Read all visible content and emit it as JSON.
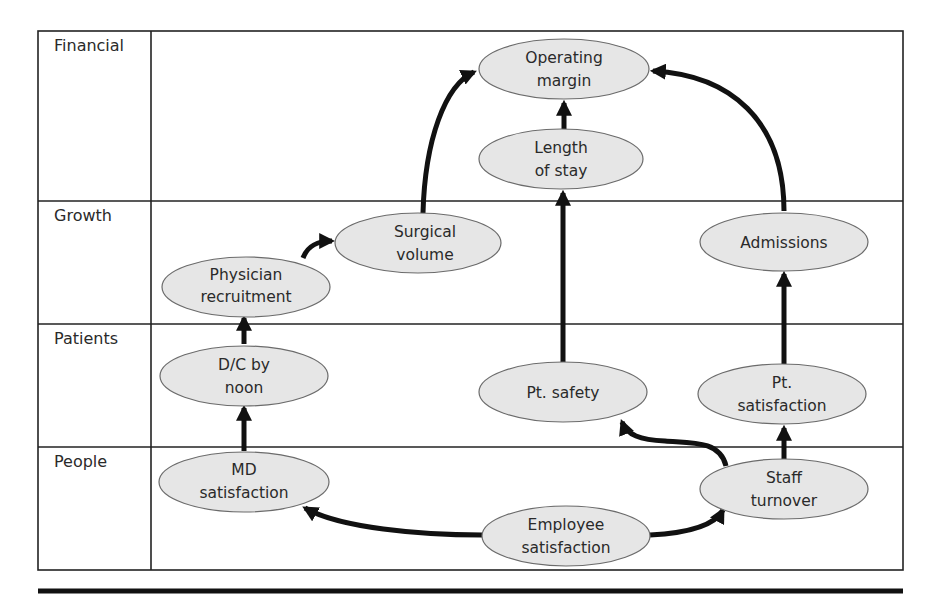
{
  "diagram": {
    "type": "strategy map",
    "rows": [
      {
        "id": "financial",
        "label": "Financial"
      },
      {
        "id": "growth",
        "label": "Growth"
      },
      {
        "id": "patients",
        "label": "Patients"
      },
      {
        "id": "people",
        "label": "People"
      }
    ],
    "nodes": {
      "operating_margin": {
        "line1": "Operating",
        "line2": "margin",
        "row": "financial"
      },
      "length_of_stay": {
        "line1": "Length",
        "line2": "of stay",
        "row": "financial"
      },
      "surgical_volume": {
        "line1": "Surgical",
        "line2": "volume",
        "row": "growth"
      },
      "admissions": {
        "line1": "Admissions",
        "line2": "",
        "row": "growth"
      },
      "physician_recruitment": {
        "line1": "Physician",
        "line2": "recruitment",
        "row": "growth"
      },
      "dc_by_noon": {
        "line1": "D/C by",
        "line2": "noon",
        "row": "patients"
      },
      "pt_safety": {
        "line1": "Pt. safety",
        "line2": "",
        "row": "patients"
      },
      "pt_satisfaction": {
        "line1": "Pt.",
        "line2": "satisfaction",
        "row": "patients"
      },
      "md_satisfaction": {
        "line1": "MD",
        "line2": "satisfaction",
        "row": "people"
      },
      "staff_turnover": {
        "line1": "Staff",
        "line2": "turnover",
        "row": "people"
      },
      "employee_satisfaction": {
        "line1": "Employee",
        "line2": "satisfaction",
        "row": "people"
      }
    },
    "edges": [
      {
        "from": "Employee satisfaction",
        "to": "MD satisfaction"
      },
      {
        "from": "Employee satisfaction",
        "to": "Staff turnover"
      },
      {
        "from": "MD satisfaction",
        "to": "D/C by noon"
      },
      {
        "from": "D/C by noon",
        "to": "Physician recruitment"
      },
      {
        "from": "Physician recruitment",
        "to": "Surgical volume"
      },
      {
        "from": "Surgical volume",
        "to": "Operating margin"
      },
      {
        "from": "Staff turnover",
        "to": "Pt. safety"
      },
      {
        "from": "Staff turnover",
        "to": "Pt. satisfaction"
      },
      {
        "from": "Pt. satisfaction",
        "to": "Admissions"
      },
      {
        "from": "Admissions",
        "to": "Operating margin"
      },
      {
        "from": "Pt. safety",
        "to": "Length of stay"
      },
      {
        "from": "Length of stay",
        "to": "Operating margin"
      }
    ],
    "colors": {
      "node_fill": "#e6e6e6",
      "node_stroke": "#6b6b6b",
      "arrow": "#111111",
      "grid": "#222222",
      "text": "#2a2a2a"
    }
  }
}
